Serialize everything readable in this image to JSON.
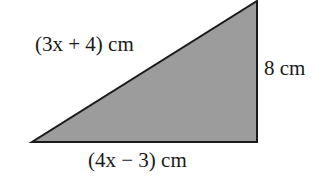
{
  "diagram": {
    "shape": "right-triangle",
    "fill_color": "#9c9c9c",
    "stroke_color": "#1a1a1a",
    "vertices": [
      [
        32,
        142
      ],
      [
        257,
        142
      ],
      [
        257,
        1
      ]
    ],
    "labels": {
      "hypotenuse": "(3x + 4) cm",
      "vertical_side": "8 cm",
      "base": "(4x − 3) cm"
    }
  }
}
